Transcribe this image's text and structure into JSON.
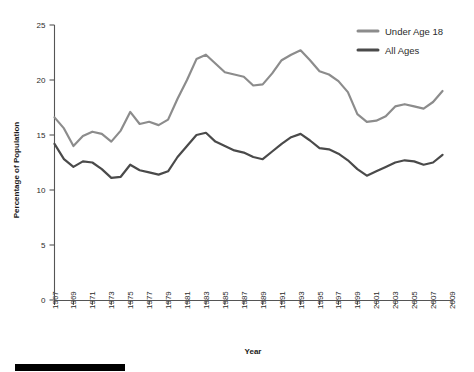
{
  "chart_data": {
    "type": "line",
    "title": "",
    "xlabel": "Year",
    "ylabel": "Percentage of Population",
    "xlim": [
      1967,
      2009
    ],
    "ylim": [
      0,
      25
    ],
    "yticks": [
      0,
      5,
      10,
      15,
      20,
      25
    ],
    "xticks": [
      1967,
      1969,
      1971,
      1973,
      1975,
      1977,
      1979,
      1981,
      1983,
      1985,
      1987,
      1989,
      1991,
      1993,
      1995,
      1997,
      1999,
      2001,
      2003,
      2005,
      2007,
      2009
    ],
    "grid": false,
    "legend_position": "top-right",
    "x": [
      1967,
      1968,
      1969,
      1970,
      1971,
      1972,
      1973,
      1974,
      1975,
      1976,
      1977,
      1978,
      1979,
      1980,
      1981,
      1982,
      1983,
      1984,
      1985,
      1986,
      1987,
      1988,
      1989,
      1990,
      1991,
      1992,
      1993,
      1994,
      1995,
      1996,
      1997,
      1998,
      1999,
      2000,
      2001,
      2002,
      2003,
      2004,
      2005,
      2006,
      2007,
      2008
    ],
    "series": [
      {
        "name": "Under Age 18",
        "color": "#8c8c8c",
        "values": [
          16.6,
          15.6,
          14.0,
          14.9,
          15.3,
          15.1,
          14.4,
          15.4,
          17.1,
          16.0,
          16.2,
          15.9,
          16.4,
          18.3,
          20.0,
          21.9,
          22.3,
          21.5,
          20.7,
          20.5,
          20.3,
          19.5,
          19.6,
          20.6,
          21.8,
          22.3,
          22.7,
          21.8,
          20.8,
          20.5,
          19.9,
          18.9,
          16.9,
          16.2,
          16.3,
          16.7,
          17.6,
          17.8,
          17.6,
          17.4,
          18.0,
          19.0
        ]
      },
      {
        "name": "All Ages",
        "color": "#4a4a4a",
        "values": [
          14.2,
          12.8,
          12.1,
          12.6,
          12.5,
          11.9,
          11.1,
          11.2,
          12.3,
          11.8,
          11.6,
          11.4,
          11.7,
          13.0,
          14.0,
          15.0,
          15.2,
          14.4,
          14.0,
          13.6,
          13.4,
          13.0,
          12.8,
          13.5,
          14.2,
          14.8,
          15.1,
          14.5,
          13.8,
          13.7,
          13.3,
          12.7,
          11.9,
          11.3,
          11.7,
          12.1,
          12.5,
          12.7,
          12.6,
          12.3,
          12.5,
          13.2
        ]
      }
    ],
    "legend": [
      {
        "label": "Under Age 18",
        "color": "#8c8c8c"
      },
      {
        "label": "All Ages",
        "color": "#4a4a4a"
      }
    ]
  },
  "decor": {
    "footer_bar": "black-rule"
  }
}
